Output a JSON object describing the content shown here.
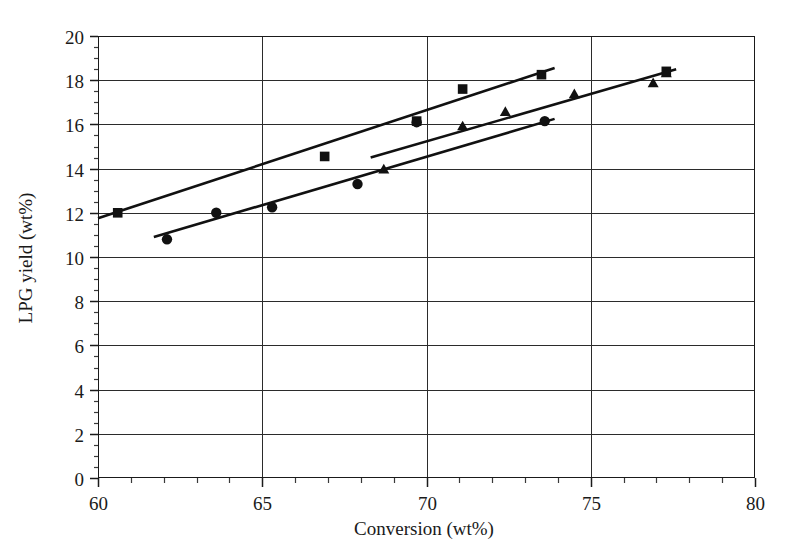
{
  "chart_data": {
    "type": "scatter",
    "title": "",
    "xlabel": "Conversion (wt%)",
    "ylabel": "LPG yield (wt%)",
    "xlim": [
      60,
      80
    ],
    "ylim": [
      0,
      20
    ],
    "xticks": [
      60,
      65,
      70,
      75,
      80
    ],
    "yticks": [
      0,
      2,
      4,
      6,
      8,
      10,
      12,
      14,
      16,
      18,
      20
    ],
    "xtick_labels": [
      "60",
      "65",
      "70",
      "75",
      "80"
    ],
    "ytick_labels": [
      "0",
      "2",
      "4",
      "6",
      "8",
      "10",
      "12",
      "14",
      "16",
      "18",
      "20"
    ],
    "grid": true,
    "grid_axis": "both",
    "legend": null,
    "legend_position": "none",
    "minor_ticks": true,
    "series": [
      {
        "name": "series-square",
        "marker": "square",
        "points": [
          {
            "x": 60.6,
            "y": 12.0
          },
          {
            "x": 66.9,
            "y": 14.55
          },
          {
            "x": 69.7,
            "y": 16.15
          },
          {
            "x": 71.1,
            "y": 17.6
          },
          {
            "x": 73.5,
            "y": 18.25
          },
          {
            "x": 77.3,
            "y": 18.4
          }
        ],
        "trendline": {
          "x0": 60.0,
          "y0": 11.75,
          "x1": 73.9,
          "y1": 18.55
        }
      },
      {
        "name": "series-triangle",
        "marker": "triangle",
        "points": [
          {
            "x": 68.7,
            "y": 14.0
          },
          {
            "x": 71.1,
            "y": 15.95
          },
          {
            "x": 72.4,
            "y": 16.6
          },
          {
            "x": 74.5,
            "y": 17.4
          },
          {
            "x": 76.9,
            "y": 17.9
          },
          {
            "x": 77.3,
            "y": 18.35
          }
        ],
        "trendline": {
          "x0": 68.3,
          "y0": 14.5,
          "x1": 77.6,
          "y1": 18.5
        }
      },
      {
        "name": "series-circle",
        "marker": "circle",
        "points": [
          {
            "x": 62.1,
            "y": 10.8
          },
          {
            "x": 63.6,
            "y": 12.0
          },
          {
            "x": 65.3,
            "y": 12.25
          },
          {
            "x": 67.9,
            "y": 13.3
          },
          {
            "x": 69.7,
            "y": 16.1
          },
          {
            "x": 73.6,
            "y": 16.15
          }
        ],
        "trendline": {
          "x0": 61.7,
          "y0": 10.9,
          "x1": 73.9,
          "y1": 16.25
        }
      }
    ]
  },
  "colors": {
    "marker": "#111111",
    "line": "#111111",
    "grid": "#2b2b2b",
    "frame": "#1a1a1a",
    "background": "#ffffff",
    "text": "#1a1a1a"
  }
}
